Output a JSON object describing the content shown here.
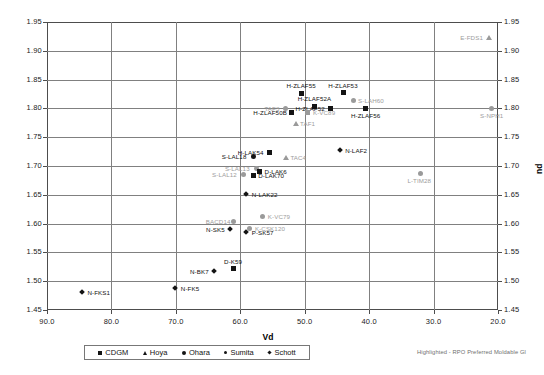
{
  "chart_data": {
    "type": "scatter",
    "title": "",
    "xlabel": "Vd",
    "ylabel": "nd",
    "ylabel_right": "nd",
    "xlim": [
      90.0,
      20.0
    ],
    "ylim": [
      1.45,
      1.95
    ],
    "x_reversed": true,
    "grid": true,
    "xticks": [
      "90.0",
      "80.0",
      "70.0",
      "60.0",
      "50.0",
      "40.0",
      "30.0",
      "20.0"
    ],
    "xtick_values": [
      90.0,
      80.0,
      70.0,
      60.0,
      50.0,
      40.0,
      30.0,
      20.0
    ],
    "yticks": [
      "1.95",
      "1.90",
      "1.85",
      "1.80",
      "1.75",
      "1.70",
      "1.65",
      "1.60",
      "1.55",
      "1.50",
      "1.45"
    ],
    "ytick_values": [
      1.95,
      1.9,
      1.85,
      1.8,
      1.75,
      1.7,
      1.65,
      1.6,
      1.55,
      1.5,
      1.45
    ],
    "legend_position": "bottom",
    "legend": [
      {
        "name": "CDGM",
        "marker": "square"
      },
      {
        "name": "Hoya",
        "marker": "triangle"
      },
      {
        "name": "Ohara",
        "marker": "circle"
      },
      {
        "name": "Sumita",
        "marker": "circle-small"
      },
      {
        "name": "Schott",
        "marker": "diamond"
      }
    ],
    "annotation": "Highlighted - RPO Preferred Moldable Gl",
    "points": [
      {
        "label": "E-FDS1",
        "vd": 21.5,
        "nd": 1.923,
        "marker": "triangle",
        "series": "Hoya",
        "highlight": true,
        "label_side": "left"
      },
      {
        "label": "H-ZLAF53",
        "vd": 44.0,
        "nd": 1.827,
        "marker": "square",
        "series": "CDGM",
        "highlight": false,
        "label_side": "above"
      },
      {
        "label": "H-ZLAF55",
        "vd": 50.5,
        "nd": 1.826,
        "marker": "square",
        "series": "CDGM",
        "highlight": false,
        "label_side": "above"
      },
      {
        "label": "S-LAH60",
        "vd": 42.5,
        "nd": 1.813,
        "marker": "circle-small",
        "series": "Sumita",
        "highlight": true,
        "label_side": "right"
      },
      {
        "label": "H-ZLAF52A",
        "vd": 48.5,
        "nd": 1.804,
        "marker": "square",
        "series": "CDGM",
        "highlight": false,
        "label_side": "above"
      },
      {
        "label": "TAF3",
        "vd": 53.0,
        "nd": 1.8,
        "marker": "circle",
        "series": "Ohara",
        "highlight": true,
        "label_side": "left"
      },
      {
        "label": "H-ZLAF52",
        "vd": 46.0,
        "nd": 1.8,
        "marker": "square",
        "series": "CDGM",
        "highlight": false,
        "label_side": "left"
      },
      {
        "label": "H-ZLAF56",
        "vd": 40.5,
        "nd": 1.8,
        "marker": "square",
        "series": "CDGM",
        "highlight": false,
        "label_side": "below"
      },
      {
        "label": "S-NPH1",
        "vd": 21.0,
        "nd": 1.8,
        "marker": "circle-small",
        "series": "Sumita",
        "highlight": true,
        "label_side": "below"
      },
      {
        "label": "H-ZLAF50B",
        "vd": 52.0,
        "nd": 1.793,
        "marker": "square",
        "series": "CDGM",
        "highlight": false,
        "label_side": "left"
      },
      {
        "label": "K-VC89",
        "vd": 49.5,
        "nd": 1.793,
        "marker": "square",
        "series": "CDGM",
        "highlight": true,
        "label_side": "right"
      },
      {
        "label": "TAF1",
        "vd": 51.5,
        "nd": 1.773,
        "marker": "triangle",
        "series": "Hoya",
        "highlight": true,
        "label_side": "right"
      },
      {
        "label": "N-LAF2",
        "vd": 44.5,
        "nd": 1.727,
        "marker": "diamond",
        "series": "Schott",
        "highlight": false,
        "label_side": "right"
      },
      {
        "label": "H-LAK54",
        "vd": 55.5,
        "nd": 1.723,
        "marker": "square",
        "series": "CDGM",
        "highlight": false,
        "label_side": "left"
      },
      {
        "label": "S-LAL18",
        "vd": 58.0,
        "nd": 1.716,
        "marker": "circle-small",
        "series": "Sumita",
        "highlight": false,
        "label_side": "left"
      },
      {
        "label": "TAC4",
        "vd": 53.0,
        "nd": 1.714,
        "marker": "triangle",
        "series": "Hoya",
        "highlight": true,
        "label_side": "right"
      },
      {
        "label": "S-LAL13",
        "vd": 57.5,
        "nd": 1.695,
        "marker": "circle-small",
        "series": "Sumita",
        "highlight": true,
        "label_side": "left"
      },
      {
        "label": "D-LAK6",
        "vd": 57.0,
        "nd": 1.69,
        "marker": "square",
        "series": "CDGM",
        "highlight": false,
        "label_side": "right"
      },
      {
        "label": "S-LAL12",
        "vd": 59.5,
        "nd": 1.685,
        "marker": "circle-small",
        "series": "Sumita",
        "highlight": true,
        "label_side": "left"
      },
      {
        "label": "D-LAK70",
        "vd": 58.0,
        "nd": 1.683,
        "marker": "square",
        "series": "CDGM",
        "highlight": false,
        "label_side": "right"
      },
      {
        "label": "L-TIM28",
        "vd": 32.0,
        "nd": 1.687,
        "marker": "circle-small",
        "series": "Sumita",
        "highlight": true,
        "label_side": "below"
      },
      {
        "label": "N-LAK22",
        "vd": 59.0,
        "nd": 1.651,
        "marker": "diamond",
        "series": "Schott",
        "highlight": false,
        "label_side": "right"
      },
      {
        "label": "K-VC79",
        "vd": 56.5,
        "nd": 1.613,
        "marker": "circle",
        "series": "Ohara",
        "highlight": true,
        "label_side": "right"
      },
      {
        "label": "BACD14",
        "vd": 61.0,
        "nd": 1.604,
        "marker": "circle",
        "series": "Ohara",
        "highlight": true,
        "label_side": "left"
      },
      {
        "label": "K-CSK120",
        "vd": 58.5,
        "nd": 1.592,
        "marker": "circle",
        "series": "Ohara",
        "highlight": true,
        "label_side": "right"
      },
      {
        "label": "N-SK5",
        "vd": 61.5,
        "nd": 1.589,
        "marker": "diamond",
        "series": "Schott",
        "highlight": false,
        "label_side": "left"
      },
      {
        "label": "P-SK57",
        "vd": 59.0,
        "nd": 1.585,
        "marker": "diamond",
        "series": "Schott",
        "highlight": false,
        "label_side": "right"
      },
      {
        "label": "D-K59",
        "vd": 61.0,
        "nd": 1.522,
        "marker": "square",
        "series": "CDGM",
        "highlight": false,
        "label_side": "above"
      },
      {
        "label": "N-BK7",
        "vd": 64.0,
        "nd": 1.517,
        "marker": "diamond",
        "series": "Schott",
        "highlight": false,
        "label_side": "left"
      },
      {
        "label": "N-FK5",
        "vd": 70.0,
        "nd": 1.487,
        "marker": "diamond",
        "series": "Schott",
        "highlight": false,
        "label_side": "right"
      },
      {
        "label": "N-FKS1",
        "vd": 84.5,
        "nd": 1.48,
        "marker": "diamond",
        "series": "Schott",
        "highlight": false,
        "label_side": "right"
      }
    ]
  }
}
